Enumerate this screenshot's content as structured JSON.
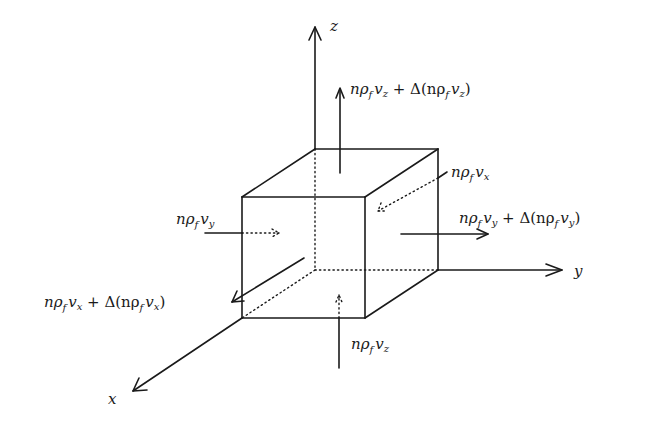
{
  "figure": {
    "type": "control-volume flux diagram",
    "axes": {
      "x": {
        "label": "x"
      },
      "y": {
        "label": "y"
      },
      "z": {
        "label": "z"
      }
    },
    "fluxes": {
      "z_in": {
        "base": "nρ",
        "sub1": "f",
        "var": "v",
        "sub2": "z",
        "suffix": ""
      },
      "z_out": {
        "base": "nρ",
        "sub1": "f",
        "var": "v",
        "sub2": "z",
        "suffix": " + Δ(nρ",
        "sub3": "f",
        "var2": "v",
        "sub4": "z",
        "close": ")"
      },
      "y_in": {
        "base": "nρ",
        "sub1": "f",
        "var": "v",
        "sub2": "y",
        "suffix": ""
      },
      "y_out": {
        "base": "nρ",
        "sub1": "f",
        "var": "v",
        "sub2": "y",
        "suffix": " + Δ(nρ",
        "sub3": "f",
        "var2": "v",
        "sub4": "y",
        "close": ")"
      },
      "x_in": {
        "base": "nρ",
        "sub1": "f",
        "var": "v",
        "sub2": "x",
        "suffix": ""
      },
      "x_out": {
        "base": "nρ",
        "sub1": "f",
        "var": "v",
        "sub2": "x",
        "suffix": " + Δ(nρ",
        "sub3": "f",
        "var2": "v",
        "sub4": "x",
        "close": ")"
      }
    },
    "colors": {
      "ink": "#1a1a1a",
      "background": "#ffffff"
    }
  }
}
